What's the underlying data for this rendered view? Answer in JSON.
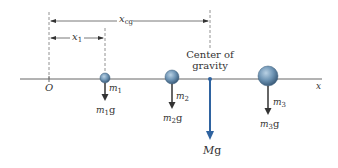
{
  "diagram": {
    "axis": {
      "origin_label": "O",
      "axis_label": "x"
    },
    "distances": [
      {
        "symbol": "x",
        "subscript": "cg"
      },
      {
        "symbol": "x",
        "subscript": "1"
      }
    ],
    "cg": {
      "label_line1": "Center of",
      "label_line2": "gravity",
      "force_symbol": "M",
      "force_suffix": "g"
    },
    "masses": [
      {
        "symbol": "m",
        "subscript": "1",
        "force_symbol": "m",
        "force_subscript": "1",
        "force_suffix": "g"
      },
      {
        "symbol": "m",
        "subscript": "2",
        "force_symbol": "m",
        "force_subscript": "2",
        "force_suffix": "g"
      },
      {
        "symbol": "m",
        "subscript": "3",
        "force_symbol": "m",
        "force_subscript": "3",
        "force_suffix": "g"
      }
    ],
    "colors": {
      "axis": "#555555",
      "ball": "#6f95b5",
      "cg_arrow": "#2f63a0",
      "force_arrow": "#333333"
    }
  }
}
